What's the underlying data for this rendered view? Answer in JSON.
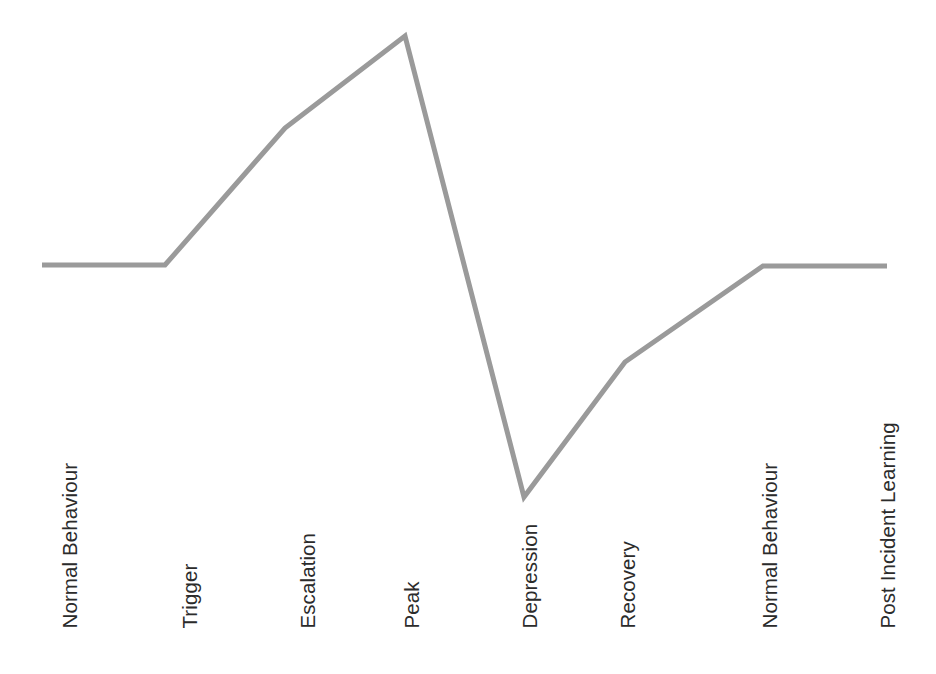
{
  "figure": {
    "background_color": "#ffffff",
    "width": 936,
    "height": 674
  },
  "style": {
    "line_color": "#9a9a9a",
    "line_width": 5,
    "label_color": "#2b2b2b",
    "label_font_size": 20.5
  },
  "labels": [
    {
      "text": "Normal Behaviour",
      "left": 80
    },
    {
      "text": "Trigger",
      "left": 200
    },
    {
      "text": "Escalation",
      "left": 318
    },
    {
      "text": "Peak",
      "left": 422
    },
    {
      "text": "Depression",
      "left": 540
    },
    {
      "text": "Recovery",
      "left": 638
    },
    {
      "text": "Normal Behaviour",
      "left": 780
    },
    {
      "text": "Post Incident Learning",
      "left": 898
    }
  ],
  "chart_data": {
    "type": "line",
    "xlabel": "",
    "ylabel": "",
    "grid": false,
    "legend": "none",
    "axes_visible": false,
    "xlim": [
      0,
      936
    ],
    "ylim": [
      674,
      0
    ],
    "categories": [
      "Normal Behaviour",
      "Trigger",
      "Escalation",
      "Peak",
      "Depression",
      "Recovery",
      "Normal Behaviour",
      "Post Incident Learning"
    ],
    "series": [
      {
        "name": "Behaviour Level",
        "points": [
          {
            "label": "Normal Behaviour start",
            "x": 42,
            "y": 265
          },
          {
            "label": "Trigger",
            "x": 165,
            "y": 265
          },
          {
            "label": "Escalation",
            "x": 285,
            "y": 128
          },
          {
            "label": "Peak",
            "x": 405,
            "y": 36
          },
          {
            "label": "Depression",
            "x": 524,
            "y": 497
          },
          {
            "label": "Recovery",
            "x": 625,
            "y": 362
          },
          {
            "label": "Normal Behaviour restored",
            "x": 763,
            "y": 266
          },
          {
            "label": "Post Incident Learning",
            "x": 887,
            "y": 266
          }
        ]
      }
    ],
    "path_d": "M 42 265 L 165 265 L 285 128 L 405 36 L 524 497 L 625 362 L 763 266 L 887 266"
  }
}
